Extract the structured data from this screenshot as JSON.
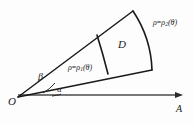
{
  "figure": {
    "type": "polar-region-diagram",
    "background_color": "#fdfdfd",
    "stroke_color": "#1a1a1a",
    "axis_color": "#3a3a3a",
    "labels": {
      "origin": "O",
      "axis_end": "A",
      "region": "D",
      "angle_lower": "α",
      "angle_upper": "β",
      "inner_curve_rho": "ρ",
      "inner_curve_equals": "=",
      "inner_curve_func": "ρ",
      "inner_curve_sub": "1",
      "inner_curve_arg": "(θ)",
      "outer_curve_rho": "ρ",
      "outer_curve_equals": "=",
      "outer_curve_func": "ρ",
      "outer_curve_sub": "2",
      "outer_curve_arg": "(θ)"
    },
    "geometry": {
      "origin_point": "18,97",
      "axis_line": "18,95 183,95",
      "ray_lower": "18,97 152,70",
      "ray_upper": "18,97 133,11",
      "inner_arc": "M 98,36 Q 104,55 108,74",
      "outer_arc": "M 133,11 Q 152,40 152,70",
      "angle_arc_alpha": "M 50,95 Q 56,94 60,93",
      "angle_arc_beta": "M 44,92 Q 50,87 54,82",
      "arrow_tip": "183,95"
    }
  }
}
